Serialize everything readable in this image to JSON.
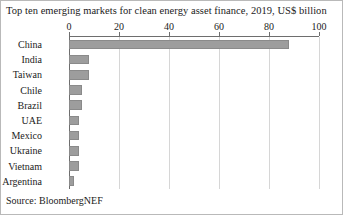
{
  "title": "Top ten emerging markets for clean energy asset finance, 2019, US$ billion",
  "source": "Source: BloombergNEF",
  "colors": {
    "bar": "#9d9d9d",
    "gridline": "#d6d6d6",
    "axis": "#6e6e6e",
    "text": "#1b1b1b",
    "background": "#ffffff",
    "border": "#b9b9b9"
  },
  "chart_data": {
    "type": "bar",
    "orientation": "horizontal",
    "title": "Top ten emerging markets for clean energy asset finance, 2019, US$ billion",
    "xlabel": "",
    "ylabel": "",
    "xlim": [
      0,
      100
    ],
    "xticks": [
      0,
      20,
      40,
      60,
      80,
      100
    ],
    "xtick_labels": [
      "0",
      "20",
      "40",
      "60",
      "80",
      "100"
    ],
    "grid": "vertical",
    "legend": "none",
    "units": "US$ billion",
    "year": 2019,
    "categories": [
      "China",
      "India",
      "Taiwan",
      "Chile",
      "Brazil",
      "UAE",
      "Mexico",
      "Ukraine",
      "Vietnam",
      "Argentina"
    ],
    "values": [
      88,
      8,
      8,
      5,
      5,
      4,
      4,
      4,
      4,
      2
    ],
    "series": [
      {
        "name": "Clean energy asset finance 2019",
        "values": [
          88,
          8,
          8,
          5,
          5,
          4,
          4,
          4,
          4,
          2
        ]
      }
    ]
  }
}
